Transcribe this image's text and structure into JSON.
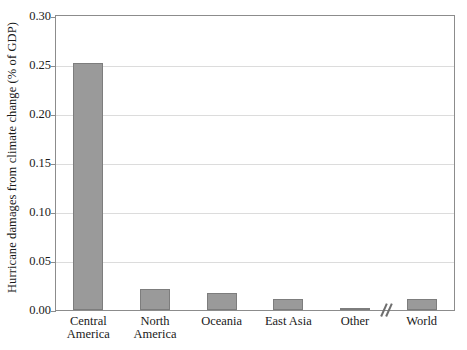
{
  "chart_data": {
    "type": "bar",
    "title": "",
    "xlabel": "",
    "ylabel": "Hurricane damages from climate change (% of GDP)",
    "categories": [
      "Central America",
      "North America",
      "Oceania",
      "East Asia",
      "Other",
      "World"
    ],
    "values": [
      0.252,
      0.021,
      0.017,
      0.011,
      0.001,
      0.011
    ],
    "ylim": [
      0.0,
      0.3
    ],
    "ytick_values": [
      0.3,
      0.25,
      0.2,
      0.15,
      0.1,
      0.05,
      0.0
    ],
    "ytick_labels": [
      "0.30",
      "0.25",
      "0.20",
      "0.15",
      "0.10",
      "0.05",
      "0.00"
    ],
    "grid": true,
    "legend": false,
    "legend_position": "none",
    "annotations": [
      {
        "name": "x-axis-break",
        "symbol": "//",
        "between": [
          "Other",
          "World"
        ],
        "description": "axis break marker on the x-axis between Other and World"
      }
    ],
    "series": [
      {
        "name": "Hurricane damages from climate change (% of GDP)",
        "color": "#9a9a9a",
        "values": [
          0.252,
          0.021,
          0.017,
          0.011,
          0.001,
          0.011
        ]
      }
    ],
    "colors": {
      "bar_fill": "#9a9a9a",
      "bar_edge": "#7d7d7d",
      "grid": "#dcdcdc",
      "axis": "#8c8c8c",
      "text": "#1a1a1a",
      "background": "#ffffff"
    }
  }
}
